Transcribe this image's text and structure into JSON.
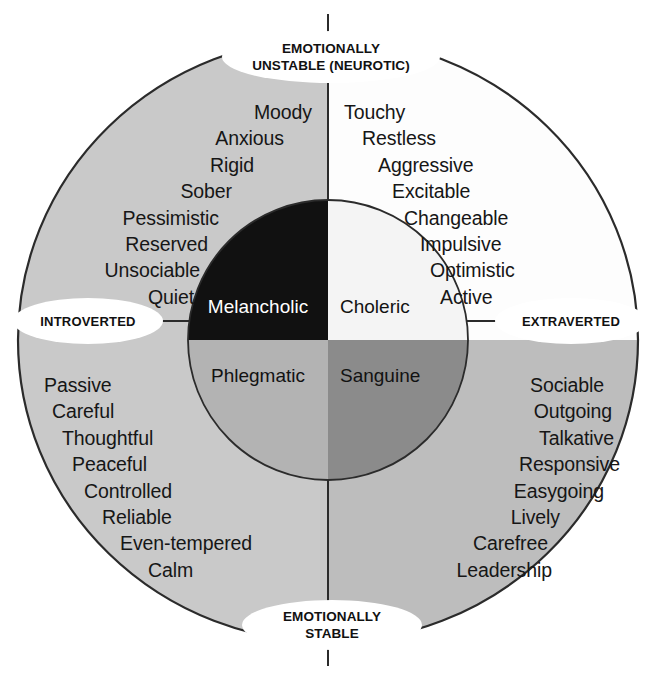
{
  "figure": {
    "outer_ring_quadrant_colors": {
      "melancholic": "#c9c9c9",
      "choleric": "#fdfdfd",
      "phlegmatic": "#c9c9c9",
      "sanguine": "#bdbdbd"
    },
    "inner_circle_colors": {
      "melancholic": "#111111",
      "choleric": "#f4f4f4",
      "phlegmatic": "#b3b3b3",
      "sanguine": "#8b8b8b"
    },
    "stroke_color": "#2b2b2b",
    "text_color": "#161616"
  },
  "poles": {
    "top_line1": "EMOTIONALLY",
    "top_line2": "UNSTABLE (NEUROTIC)",
    "bottom_line1": "EMOTIONALLY",
    "bottom_line2": "STABLE",
    "left": "INTROVERTED",
    "right": "EXTRAVERTED"
  },
  "temperaments": {
    "melancholic": "Melancholic",
    "choleric": "Choleric",
    "phlegmatic": "Phlegmatic",
    "sanguine": "Sanguine"
  },
  "traits": {
    "melancholic": [
      "Moody",
      "Anxious",
      "Rigid",
      "Sober",
      "Pessimistic",
      "Reserved",
      "Unsociable",
      "Quiet"
    ],
    "choleric": [
      "Touchy",
      "Restless",
      "Aggressive",
      "Excitable",
      "Changeable",
      "Impulsive",
      "Optimistic",
      "Active"
    ],
    "phlegmatic": [
      "Passive",
      "Careful",
      "Thoughtful",
      "Peaceful",
      "Controlled",
      "Reliable",
      "Even-tempered",
      "Calm"
    ],
    "sanguine": [
      "Sociable",
      "Outgoing",
      "Talkative",
      "Responsive",
      "Easygoing",
      "Lively",
      "Carefree",
      "Leadership"
    ]
  }
}
